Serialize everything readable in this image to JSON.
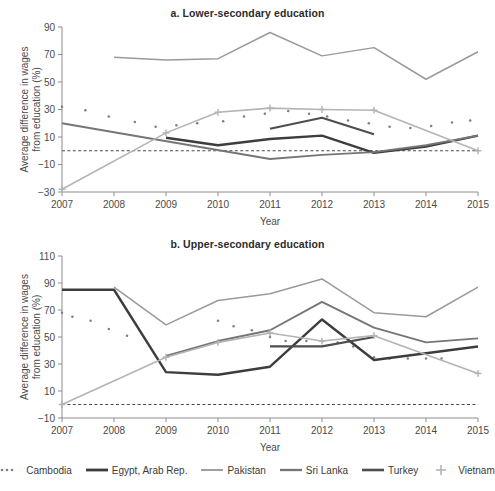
{
  "figure": {
    "axis_y_title": "Average difference in wages from education (%)",
    "axis_x_title": "Year"
  },
  "panels": [
    {
      "key": "a",
      "title": "a. Lower-secondary education"
    },
    {
      "key": "b",
      "title": "b. Upper-secondary education"
    }
  ],
  "legend": {
    "items": [
      {
        "label": "Cambodia",
        "color": "#7f7f7f",
        "style": "dotted",
        "width": 2.2
      },
      {
        "label": "Egypt, Arab Rep.",
        "color": "#3d3d3d",
        "style": "solid",
        "width": 2.4
      },
      {
        "label": "Pakistan",
        "color": "#9a9a9a",
        "style": "solid",
        "width": 1.5
      },
      {
        "label": "Sri Lanka",
        "color": "#767676",
        "style": "solid",
        "width": 1.9
      },
      {
        "label": "Turkey",
        "color": "#4e4e4e",
        "style": "solid",
        "width": 2.2
      },
      {
        "label": "Vietnam",
        "color": "#b4b4b4",
        "style": "plus",
        "width": 1.6
      }
    ]
  },
  "chart_data": [
    {
      "type": "line",
      "panel": "a",
      "title": "a. Lower-secondary education",
      "xlabel": "Year",
      "ylabel": "Average difference in wages from education (%)",
      "x": [
        2007,
        2008,
        2009,
        2010,
        2011,
        2012,
        2013,
        2014,
        2015
      ],
      "xlim": [
        2007,
        2015
      ],
      "ylim": [
        -30,
        90
      ],
      "yticks": [
        -30,
        -10,
        10,
        30,
        50,
        70,
        90
      ],
      "xticks": [
        2007,
        2008,
        2009,
        2010,
        2011,
        2012,
        2013,
        2014,
        2015
      ],
      "grid": false,
      "zero_reference_line": 0,
      "series": [
        {
          "name": "Cambodia",
          "marker": "dot",
          "points": [
            [
              2007,
              32
            ],
            [
              2007.45,
              29.5
            ],
            [
              2007.9,
              25
            ],
            [
              2008.4,
              21
            ],
            [
              2008.8,
              17.5
            ],
            [
              2009.2,
              18.5
            ],
            [
              2009.6,
              20
            ],
            [
              2010.1,
              21.5
            ],
            [
              2010.5,
              25
            ],
            [
              2010.9,
              27
            ],
            [
              2011.35,
              29
            ],
            [
              2011.75,
              27
            ],
            [
              2012.1,
              25
            ],
            [
              2012.5,
              22
            ],
            [
              2012.9,
              20
            ],
            [
              2013.3,
              17.5
            ],
            [
              2013.7,
              16.5
            ],
            [
              2014.1,
              18
            ],
            [
              2014.5,
              20.5
            ],
            [
              2014.85,
              22
            ]
          ]
        },
        {
          "name": "Egypt, Arab Rep.",
          "marker": "none",
          "points": [
            [
              2009,
              9.5
            ],
            [
              2010,
              4
            ],
            [
              2011,
              8.5
            ],
            [
              2012,
              11
            ],
            [
              2013,
              -1.5
            ],
            [
              2014,
              3
            ],
            [
              2015,
              11
            ]
          ]
        },
        {
          "name": "Pakistan",
          "marker": "none",
          "points": [
            [
              2008,
              68
            ],
            [
              2009,
              66
            ],
            [
              2010,
              67
            ],
            [
              2011,
              86
            ],
            [
              2012,
              69
            ],
            [
              2013,
              75
            ],
            [
              2014,
              52
            ],
            [
              2015,
              72
            ]
          ]
        },
        {
          "name": "Sri Lanka",
          "marker": "none",
          "points": [
            [
              2007,
              20
            ],
            [
              2008,
              13.5
            ],
            [
              2011,
              -6
            ],
            [
              2012,
              -3
            ],
            [
              2013,
              -1
            ],
            [
              2014,
              4
            ],
            [
              2015,
              11
            ]
          ]
        },
        {
          "name": "Turkey",
          "marker": "none",
          "points": [
            [
              2011,
              16
            ],
            [
              2012,
              24
            ],
            [
              2013,
              12
            ]
          ]
        },
        {
          "name": "Vietnam",
          "marker": "plus",
          "points": [
            [
              2007,
              -28
            ],
            [
              2009,
              13
            ],
            [
              2010,
              28
            ],
            [
              2011,
              31
            ],
            [
              2012,
              30
            ],
            [
              2013,
              29.5
            ],
            [
              2015,
              0
            ]
          ]
        }
      ]
    },
    {
      "type": "line",
      "panel": "b",
      "title": "b. Upper-secondary education",
      "xlabel": "Year",
      "ylabel": "Average difference in wages from education (%)",
      "x": [
        2007,
        2008,
        2009,
        2010,
        2011,
        2012,
        2013,
        2014,
        2015
      ],
      "xlim": [
        2007,
        2015
      ],
      "ylim": [
        -10,
        110
      ],
      "yticks": [
        -10,
        10,
        30,
        50,
        70,
        90,
        110
      ],
      "xticks": [
        2007,
        2008,
        2009,
        2010,
        2011,
        2012,
        2013,
        2014,
        2015
      ],
      "grid": false,
      "zero_reference_line": 0,
      "series": [
        {
          "name": "Cambodia",
          "marker": "dot",
          "points": [
            [
              2007,
              68
            ],
            [
              2007.2,
              65
            ],
            [
              2007.55,
              62
            ],
            [
              2007.9,
              56
            ],
            [
              2008.25,
              51
            ],
            [
              2010,
              62
            ],
            [
              2010.3,
              58
            ],
            [
              2010.65,
              55
            ],
            [
              2011,
              50
            ],
            [
              2011.3,
              47
            ],
            [
              2011.7,
              47
            ],
            [
              2012,
              47
            ],
            [
              2012.3,
              46
            ],
            [
              2012.6,
              43
            ],
            [
              2013,
              35
            ],
            [
              2013.3,
              34
            ],
            [
              2013.65,
              34
            ],
            [
              2014,
              34
            ],
            [
              2014.3,
              34
            ]
          ]
        },
        {
          "name": "Egypt, Arab Rep.",
          "marker": "none",
          "points": [
            [
              2007,
              85
            ],
            [
              2008,
              85
            ],
            [
              2009,
              24
            ],
            [
              2010,
              22
            ],
            [
              2011,
              28
            ],
            [
              2012,
              63
            ],
            [
              2013,
              33
            ],
            [
              2014,
              38
            ],
            [
              2015,
              43
            ]
          ]
        },
        {
          "name": "Pakistan",
          "marker": "none",
          "points": [
            [
              2008,
              87
            ],
            [
              2009,
              59
            ],
            [
              2010,
              77
            ],
            [
              2011,
              82
            ],
            [
              2012,
              93
            ],
            [
              2013,
              68
            ],
            [
              2014,
              65
            ],
            [
              2015,
              87
            ]
          ]
        },
        {
          "name": "Sri Lanka",
          "marker": "none",
          "points": [
            [
              2009,
              36
            ],
            [
              2010,
              47
            ],
            [
              2011,
              55
            ],
            [
              2012,
              76
            ],
            [
              2013,
              57
            ],
            [
              2014,
              46
            ],
            [
              2015,
              49
            ]
          ]
        },
        {
          "name": "Turkey",
          "marker": "none",
          "points": [
            [
              2011,
              43
            ],
            [
              2012,
              43
            ],
            [
              2013,
              50
            ]
          ]
        },
        {
          "name": "Vietnam",
          "marker": "plus",
          "points": [
            [
              2007,
              0
            ],
            [
              2009,
              35
            ],
            [
              2010,
              46
            ],
            [
              2011,
              53
            ],
            [
              2012,
              47
            ],
            [
              2013,
              51
            ],
            [
              2015,
              23
            ]
          ]
        }
      ]
    }
  ]
}
